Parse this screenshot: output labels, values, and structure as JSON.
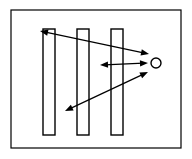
{
  "figure": {
    "title": "",
    "width": 192,
    "height": 159,
    "background_color": "#ffffff",
    "stroke_color": "#000000",
    "frame": {
      "label": "diagram-frame",
      "x": 11,
      "y": 10,
      "width": 170,
      "height": 138,
      "stroke_width": 1.2,
      "fill": "#ffffff"
    },
    "bars": [
      {
        "label": "bar-1",
        "x": 43,
        "y": 29,
        "width": 12,
        "height": 106,
        "stroke_width": 1.4,
        "fill": "#ffffff"
      },
      {
        "label": "bar-2",
        "x": 77,
        "y": 29,
        "width": 12,
        "height": 106,
        "stroke_width": 1.4,
        "fill": "#ffffff"
      },
      {
        "label": "bar-3",
        "x": 111,
        "y": 29,
        "width": 12,
        "height": 106,
        "stroke_width": 1.4,
        "fill": "#ffffff"
      }
    ],
    "circle": {
      "label": "source-circle",
      "cx": 156,
      "cy": 63,
      "r": 5,
      "stroke_width": 1.4,
      "fill": "#ffffff"
    },
    "arrows": [
      {
        "label": "arrow-upper-diagonal",
        "x1": 40,
        "y1": 31,
        "x2": 149,
        "y2": 54,
        "double_headed": true,
        "stroke_width": 1.2
      },
      {
        "label": "arrow-horizontal",
        "x1": 100,
        "y1": 65,
        "x2": 148,
        "y2": 63,
        "double_headed": true,
        "stroke_width": 1.2
      },
      {
        "label": "arrow-lower-diagonal",
        "x1": 65,
        "y1": 111,
        "x2": 148,
        "y2": 72,
        "double_headed": true,
        "stroke_width": 1.2
      }
    ],
    "arrowhead": {
      "length": 8,
      "half_width": 3.2
    }
  }
}
